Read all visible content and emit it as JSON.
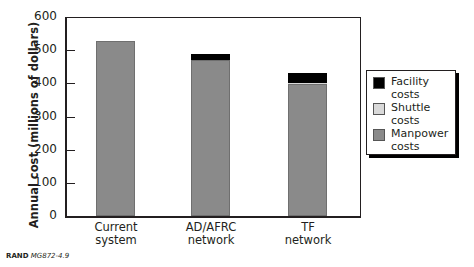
{
  "chart_data": {
    "type": "bar",
    "stacked": true,
    "title": "",
    "xlabel": "",
    "ylabel": "Annual cost (millions of dollars)",
    "ylim": [
      0,
      600
    ],
    "yticks": [
      0,
      100,
      200,
      300,
      400,
      500,
      600
    ],
    "categories": [
      "Current system",
      "AD/AFRC network",
      "TF network"
    ],
    "series": [
      {
        "name": "Manpower costs",
        "color": "#8a8a8a",
        "values": [
          528,
          469,
          397
        ]
      },
      {
        "name": "Shuttle costs",
        "color": "#d9d9d9",
        "values": [
          0,
          0,
          5
        ]
      },
      {
        "name": "Facility costs",
        "color": "#000000",
        "values": [
          0,
          21,
          28
        ]
      }
    ],
    "totals": [
      528,
      490,
      430
    ],
    "legend_position": "right",
    "grid": false
  },
  "axis": {
    "ylabel": "Annual cost (millions of dollars)",
    "yticks": [
      "0",
      "100",
      "200",
      "300",
      "400",
      "500",
      "600"
    ],
    "xlabels": [
      {
        "line1": "Current",
        "line2": "system"
      },
      {
        "line1": "AD/AFRC",
        "line2": "network"
      },
      {
        "line1": "TF",
        "line2": "network"
      }
    ]
  },
  "legend": [
    {
      "line1": "Facility",
      "line2": "costs",
      "color": "#000000"
    },
    {
      "line1": "Shuttle",
      "line2": "costs",
      "color": "#d9d9d9"
    },
    {
      "line1": "Manpower",
      "line2": "costs",
      "color": "#8a8a8a"
    }
  ],
  "credit": {
    "org": "RAND",
    "id": "MG872-4.9"
  }
}
